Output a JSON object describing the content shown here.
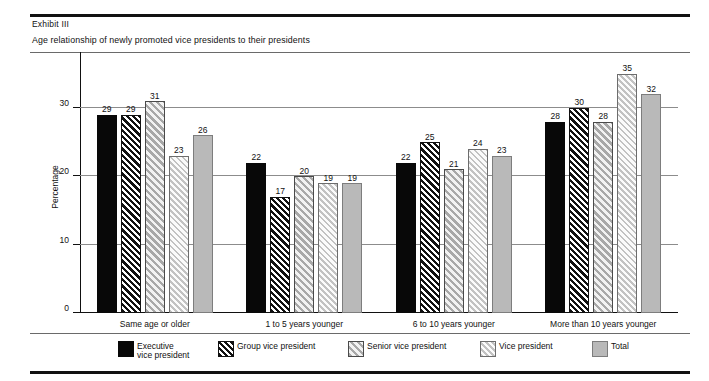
{
  "header": {
    "exhibit": "Exhibit III",
    "subtitle": "Age relationship of newly promoted vice presidents to their presidents"
  },
  "chart_data": {
    "type": "bar",
    "title": "Age relationship of newly promoted vice presidents to their presidents",
    "xlabel": "",
    "ylabel": "Percentage",
    "ylim": [
      0,
      37
    ],
    "yticks": [
      0,
      10,
      20,
      30
    ],
    "grid": true,
    "legend_position": "bottom",
    "categories": [
      "Same age or older",
      "1 to 5 years younger",
      "6 to 10 years younger",
      "More than 10 years younger"
    ],
    "series": [
      {
        "name": "Executive\nvice president",
        "legend_label": "Executive\nvice president",
        "fill": "solid-black",
        "values": [
          29,
          22,
          22,
          28
        ]
      },
      {
        "name": "Group vice president",
        "legend_label": "Group vice president",
        "fill": "dark-hatch",
        "values": [
          29,
          17,
          25,
          30
        ]
      },
      {
        "name": "Senior vice president",
        "legend_label": "Senior vice president",
        "fill": "medium-hatch",
        "values": [
          31,
          20,
          21,
          28
        ]
      },
      {
        "name": "Vice president",
        "legend_label": "Vice president",
        "fill": "light-hatch",
        "values": [
          23,
          19,
          24,
          35
        ]
      },
      {
        "name": "Total",
        "legend_label": "Total",
        "fill": "solid-gray",
        "values": [
          26,
          19,
          23,
          32
        ]
      }
    ]
  },
  "colors": {
    "exec": "#080808",
    "group": "#111111",
    "senior": "#a8a8a8",
    "vp": "#c2c2c2",
    "total": "#b9b9b9",
    "rule": "#111111",
    "grid": "#8c8c8c"
  }
}
